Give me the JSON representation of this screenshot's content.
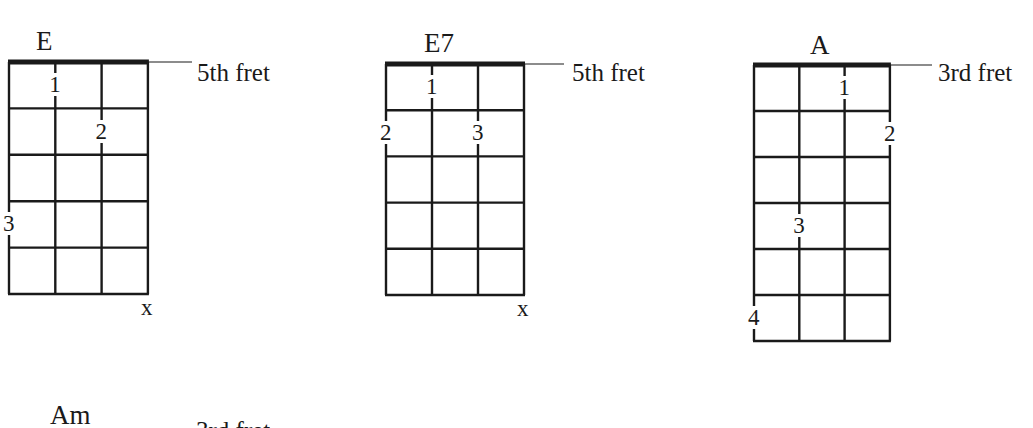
{
  "chords": [
    {
      "name": "E",
      "position_label": "5th fret",
      "strings": 4,
      "frets": 5,
      "grid": {
        "left": 9,
        "top": 62,
        "string_spacing": 46.3,
        "fret_spacing": 46.4
      },
      "label_line": {
        "x1": 148,
        "x2": 192,
        "y": 62
      },
      "label_pos": {
        "x": 197,
        "y": 60
      },
      "title_pos": {
        "x": 36,
        "y": 28
      },
      "fingers": [
        {
          "string": 2,
          "fret": 1,
          "label": "1"
        },
        {
          "string": 3,
          "fret": 2,
          "label": "2"
        },
        {
          "string": 1,
          "fret": 4,
          "label": "3"
        }
      ],
      "muted": [
        {
          "string": 4,
          "label": "x"
        }
      ]
    },
    {
      "name": "E7",
      "position_label": "5th fret",
      "strings": 4,
      "frets": 5,
      "grid": {
        "left": 386,
        "top": 64,
        "string_spacing": 46,
        "fret_spacing": 46.2
      },
      "label_line": {
        "x1": 524,
        "x2": 564,
        "y": 64
      },
      "label_pos": {
        "x": 572,
        "y": 60
      },
      "title_pos": {
        "x": 424,
        "y": 30
      },
      "fingers": [
        {
          "string": 2,
          "fret": 1,
          "label": "1"
        },
        {
          "string": 1,
          "fret": 2,
          "label": "2"
        },
        {
          "string": 3,
          "fret": 2,
          "label": "3"
        }
      ],
      "muted": [
        {
          "string": 4,
          "label": "x"
        }
      ]
    },
    {
      "name": "A",
      "position_label": "3rd fret",
      "strings": 4,
      "frets": 6,
      "grid": {
        "left": 754,
        "top": 65,
        "string_spacing": 45.3,
        "fret_spacing": 46
      },
      "label_line": {
        "x1": 890,
        "x2": 932,
        "y": 65
      },
      "label_pos": {
        "x": 938,
        "y": 60
      },
      "title_pos": {
        "x": 810,
        "y": 32
      },
      "fingers": [
        {
          "string": 3,
          "fret": 1,
          "label": "1"
        },
        {
          "string": 4,
          "fret": 2,
          "label": "2"
        },
        {
          "string": 2,
          "fret": 4,
          "label": "3"
        },
        {
          "string": 1,
          "fret": 6,
          "label": "4"
        }
      ],
      "muted": []
    }
  ],
  "next_chord": {
    "name": "Am",
    "cut_text": "3rd fret"
  },
  "colors": {
    "ink": "#1a1a1a",
    "background": "#ffffff"
  }
}
